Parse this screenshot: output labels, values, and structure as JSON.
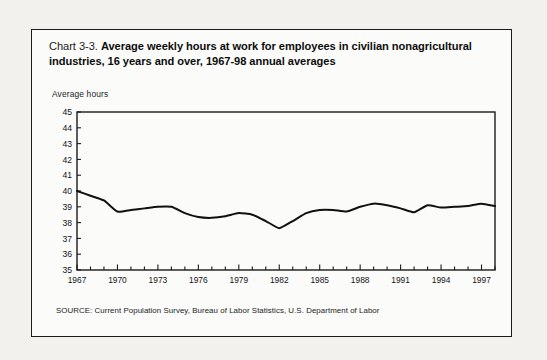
{
  "figure": {
    "chart_number": "Chart 3-3.",
    "title": "Average weekly hours at work for employees in civilian nonagricultural industries, 16 years and over, 1967-98 annual averages",
    "axis_label": "Average hours",
    "source": "SOURCE: Current Population Survey, Bureau of Labor Statistics, U.S. Department of Labor",
    "line_color": "#101010",
    "frame_color": "#1b1b1b"
  },
  "chart_data": {
    "type": "line",
    "title": "Chart 3-3. Average weekly hours at work for employees in civilian nonagricultural industries, 16 years and over, 1967-98 annual averages",
    "subtitle": "",
    "xlabel": "",
    "ylabel": "Average hours",
    "grid": false,
    "legend": "none",
    "xlim": [
      1967,
      1998
    ],
    "ylim": [
      35,
      45
    ],
    "ytick_values": [
      35,
      36,
      37,
      38,
      39,
      40,
      41,
      42,
      43,
      44,
      45
    ],
    "ytick_labels": [
      "35",
      "36",
      "37",
      "38",
      "39",
      "40",
      "41",
      "42",
      "43",
      "44",
      "45"
    ],
    "xtick_values": [
      1967,
      1970,
      1973,
      1976,
      1979,
      1982,
      1985,
      1988,
      1991,
      1994,
      1997
    ],
    "xtick_labels": [
      "1967",
      "1970",
      "1973",
      "1976",
      "1979",
      "1982",
      "1985",
      "1988",
      "1991",
      "1994",
      "1997"
    ],
    "x_minor_ticks_every": 1,
    "x": [
      1967,
      1968,
      1969,
      1970,
      1971,
      1972,
      1973,
      1974,
      1975,
      1976,
      1977,
      1978,
      1979,
      1980,
      1981,
      1982,
      1983,
      1984,
      1985,
      1986,
      1987,
      1988,
      1989,
      1990,
      1991,
      1992,
      1993,
      1994,
      1995,
      1996,
      1997,
      1998
    ],
    "values": [
      40.0,
      39.7,
      39.4,
      38.7,
      38.8,
      38.9,
      39.0,
      39.0,
      38.6,
      38.35,
      38.3,
      38.4,
      38.6,
      38.5,
      38.1,
      37.65,
      38.1,
      38.6,
      38.8,
      38.8,
      38.7,
      39.0,
      39.2,
      39.1,
      38.9,
      38.65,
      39.1,
      38.95,
      39.0,
      39.05,
      39.2,
      39.05
    ],
    "series": [
      {
        "name": "Average weekly hours at work",
        "values": [
          40.0,
          39.7,
          39.4,
          38.7,
          38.8,
          38.9,
          39.0,
          39.0,
          38.6,
          38.35,
          38.3,
          38.4,
          38.6,
          38.5,
          38.1,
          37.65,
          38.1,
          38.6,
          38.8,
          38.8,
          38.7,
          39.0,
          39.2,
          39.1,
          38.9,
          38.65,
          39.1,
          38.95,
          39.0,
          39.05,
          39.2,
          39.05
        ]
      }
    ]
  }
}
